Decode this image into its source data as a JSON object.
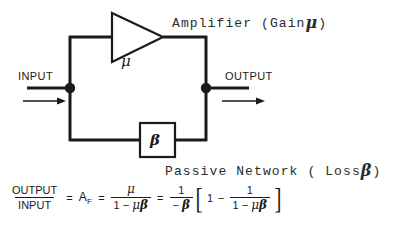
{
  "diagram": {
    "title_annotation": "Amplifier (Gain ",
    "amplifier_label_prefix": "Amplifier (Gain",
    "amplifier_label_symbol": "μ",
    "amplifier_label_suffix": ")",
    "network_label_prefix": "Passive Network ( Loss",
    "network_label_symbol": "β",
    "network_label_suffix": ")",
    "amplifier_block_symbol": "μ",
    "feedback_block_symbol": "β",
    "input_label": "INPUT",
    "output_label": "OUTPUT",
    "line_color": "#1a1a1a",
    "background_color": "#ffffff"
  },
  "equation": {
    "lhs_numerator": "OUTPUT",
    "lhs_denominator": "INPUT",
    "equals_1": "=",
    "af_base": "A",
    "af_subscript": "F",
    "equals_2": "=",
    "frac1_numerator": "μ",
    "frac1_denominator_one": "1",
    "frac1_denominator_minus": "−",
    "frac1_denominator_mu": "μ",
    "frac1_denominator_beta": "β",
    "equals_3": "=",
    "frac2_numerator": "1",
    "frac2_denominator_minus": "−",
    "frac2_denominator_beta": "β",
    "bracket_open": "[",
    "bracket_one": "1",
    "bracket_minus": "−",
    "frac3_numerator": "1",
    "frac3_denominator_one": "1",
    "frac3_denominator_minus": "−",
    "frac3_denominator_mu": "μ",
    "frac3_denominator_beta": "β",
    "bracket_close": "]"
  }
}
